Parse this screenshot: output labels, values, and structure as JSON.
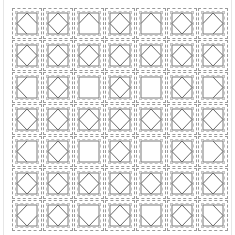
{
  "puzzle": {
    "rows": 7,
    "cols": 7,
    "edge_order": [
      "top-left",
      "top-right",
      "bottom-right",
      "bottom-left"
    ],
    "colors": {
      "outer_dash": "#9a9a9a",
      "inner_dash": "#c4c4c4",
      "square_stroke": "#7a7a7a",
      "diamond_stroke": "#6a6a6a",
      "background": "#ffffff"
    },
    "cells": [
      [
        [
          1,
          1,
          0,
          1
        ],
        [
          1,
          1,
          1,
          1
        ],
        [
          1,
          1,
          0,
          0
        ],
        [
          1,
          1,
          1,
          1
        ],
        [
          1,
          1,
          0,
          0
        ],
        [
          1,
          1,
          1,
          1
        ],
        [
          1,
          1,
          1,
          0
        ]
      ],
      [
        [
          1,
          1,
          1,
          1
        ],
        [
          1,
          1,
          1,
          1
        ],
        [
          1,
          1,
          1,
          1
        ],
        [
          1,
          1,
          1,
          1
        ],
        [
          1,
          1,
          1,
          1
        ],
        [
          1,
          1,
          1,
          1
        ],
        [
          1,
          1,
          1,
          1
        ]
      ],
      [
        [
          1,
          0,
          0,
          1
        ],
        [
          1,
          1,
          1,
          1
        ],
        [
          0,
          0,
          0,
          0
        ],
        [
          1,
          1,
          1,
          1
        ],
        [
          0,
          0,
          0,
          0
        ],
        [
          1,
          1,
          1,
          1
        ],
        [
          0,
          1,
          1,
          0
        ]
      ],
      [
        [
          1,
          1,
          1,
          1
        ],
        [
          1,
          1,
          1,
          1
        ],
        [
          1,
          1,
          1,
          1
        ],
        [
          1,
          1,
          1,
          1
        ],
        [
          1,
          1,
          1,
          1
        ],
        [
          1,
          1,
          1,
          1
        ],
        [
          1,
          1,
          1,
          1
        ]
      ],
      [
        [
          1,
          0,
          0,
          1
        ],
        [
          1,
          1,
          1,
          1
        ],
        [
          0,
          0,
          0,
          0
        ],
        [
          1,
          1,
          1,
          1
        ],
        [
          0,
          0,
          0,
          0
        ],
        [
          1,
          1,
          1,
          1
        ],
        [
          0,
          1,
          1,
          0
        ]
      ],
      [
        [
          1,
          1,
          1,
          1
        ],
        [
          1,
          1,
          1,
          1
        ],
        [
          1,
          1,
          1,
          1
        ],
        [
          1,
          1,
          1,
          1
        ],
        [
          1,
          1,
          1,
          1
        ],
        [
          1,
          1,
          1,
          1
        ],
        [
          1,
          1,
          1,
          1
        ]
      ],
      [
        [
          1,
          0,
          1,
          1
        ],
        [
          1,
          1,
          1,
          1
        ],
        [
          0,
          0,
          1,
          1
        ],
        [
          1,
          1,
          1,
          1
        ],
        [
          0,
          0,
          1,
          1
        ],
        [
          1,
          1,
          1,
          1
        ],
        [
          0,
          1,
          1,
          1
        ]
      ]
    ]
  }
}
